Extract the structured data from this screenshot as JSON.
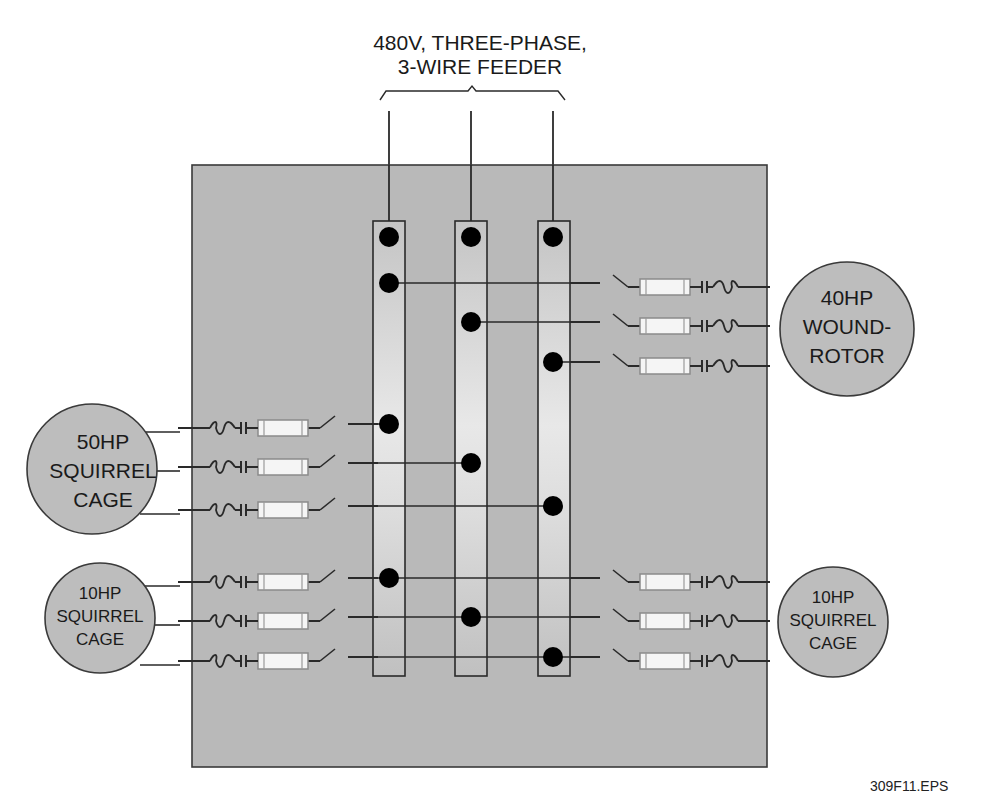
{
  "title": {
    "line1": "480V, THREE-PHASE,",
    "line2": "3-WIRE FEEDER"
  },
  "caption": "309F11.EPS",
  "colors": {
    "panel": "#b9b9b9",
    "busbar_light": "#e6e6e6",
    "motor_fill": "#bdbdbd",
    "line": "#2a2a2a",
    "dot": "#000000",
    "fuse_fill": "#f5f5f5"
  },
  "busbars": [
    {
      "phase": "A"
    },
    {
      "phase": "B"
    },
    {
      "phase": "C"
    }
  ],
  "motors": [
    {
      "id": "motor-40hp",
      "lines": [
        "40HP",
        "WOUND-",
        "ROTOR"
      ],
      "side": "right"
    },
    {
      "id": "motor-50hp",
      "lines": [
        "50HP",
        "SQUIRREL",
        "CAGE"
      ],
      "side": "left"
    },
    {
      "id": "motor-10hp-left",
      "lines": [
        "10HP",
        "SQUIRREL",
        "CAGE"
      ],
      "side": "left"
    },
    {
      "id": "motor-10hp-right",
      "lines": [
        "10HP",
        "SQUIRREL",
        "CAGE"
      ],
      "side": "right"
    }
  ],
  "components": [
    "disconnect-switch",
    "fuse",
    "contactor",
    "overload-heater"
  ]
}
